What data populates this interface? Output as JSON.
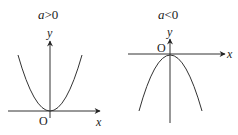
{
  "panels": [
    {
      "condition": "a>0",
      "condition_var": "a",
      "condition_op": ">",
      "condition_val": "0",
      "y_label": "y",
      "x_label": "x",
      "origin_label": "O",
      "opens": "up"
    },
    {
      "condition": "a<0",
      "condition_var": "a",
      "condition_op": "<",
      "condition_val": "0",
      "y_label": "y",
      "x_label": "x",
      "origin_label": "O",
      "opens": "down"
    }
  ],
  "colors": {
    "stroke": "#333333",
    "text": "#222222",
    "background": "#ffffff"
  }
}
